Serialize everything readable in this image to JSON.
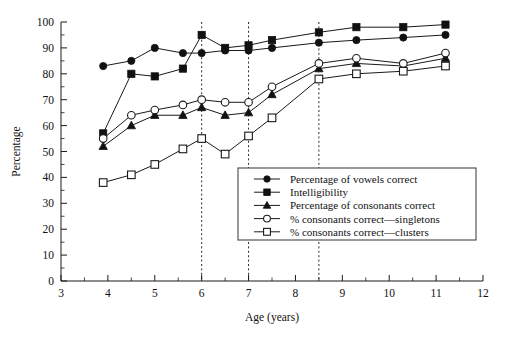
{
  "chart_data": {
    "type": "line",
    "title": "",
    "xlabel": "Age (years)",
    "ylabel": "Percentage",
    "xlim": [
      3,
      12
    ],
    "ylim": [
      0,
      100
    ],
    "xticks": [
      "3",
      "4",
      "5",
      "6",
      "7",
      "8",
      "9",
      "10",
      "11",
      "12"
    ],
    "yticks": [
      "0",
      "10",
      "20",
      "30",
      "40",
      "50",
      "60",
      "70",
      "80",
      "90",
      "100"
    ],
    "x_minor_step": 0.5,
    "y_minor_step": 5,
    "grid": false,
    "legend_position": "lower-right-inside",
    "reference_lines": [
      {
        "axis": "x",
        "value": 6,
        "style": "dotted"
      },
      {
        "axis": "x",
        "value": 7,
        "style": "dotted"
      },
      {
        "axis": "x",
        "value": 8.5,
        "style": "dotted"
      }
    ],
    "series": [
      {
        "name": "Percentage of vowels correct",
        "marker": "filled-circle",
        "x": [
          3.9,
          4.5,
          5.0,
          5.6,
          6.0,
          6.5,
          7.0,
          7.5,
          8.5,
          9.3,
          10.3,
          11.2
        ],
        "y": [
          83,
          85,
          90,
          88,
          88,
          89,
          89,
          90,
          92,
          93,
          94,
          95
        ]
      },
      {
        "name": "Intelligibility",
        "marker": "filled-square",
        "x": [
          3.9,
          4.5,
          5.0,
          5.6,
          6.0,
          6.5,
          7.0,
          7.5,
          8.5,
          9.3,
          10.3,
          11.2
        ],
        "y": [
          57,
          80,
          79,
          82,
          95,
          90,
          91,
          93,
          96,
          98,
          98,
          99
        ]
      },
      {
        "name": "Percentage of consonants correct",
        "marker": "filled-triangle",
        "x": [
          3.9,
          4.5,
          5.0,
          5.6,
          6.0,
          6.5,
          7.0,
          7.5,
          8.5,
          9.3,
          10.3,
          11.2
        ],
        "y": [
          52,
          60,
          64,
          64,
          67,
          64,
          65,
          72,
          82,
          84,
          83,
          86
        ]
      },
      {
        "name": "% consonants correct—singletons",
        "marker": "open-circle",
        "x": [
          3.9,
          4.5,
          5.0,
          5.6,
          6.0,
          6.5,
          7.0,
          7.5,
          8.5,
          9.3,
          10.3,
          11.2
        ],
        "y": [
          55,
          64,
          66,
          68,
          70,
          69,
          69,
          75,
          84,
          86,
          84,
          88
        ]
      },
      {
        "name": "% consonants correct—clusters",
        "marker": "open-square",
        "x": [
          3.9,
          4.5,
          5.0,
          5.6,
          6.0,
          6.5,
          7.0,
          7.5,
          8.5,
          9.3,
          10.3,
          11.2
        ],
        "y": [
          38,
          41,
          45,
          51,
          55,
          49,
          56,
          63,
          78,
          80,
          81,
          83
        ]
      }
    ]
  },
  "legend": {
    "items": [
      {
        "label": "Percentage of vowels correct",
        "marker": "filled-circle"
      },
      {
        "label": "Intelligibility",
        "marker": "filled-square"
      },
      {
        "label": "Percentage of consonants correct",
        "marker": "filled-triangle"
      },
      {
        "label": "% consonants correct—singletons",
        "marker": "open-circle"
      },
      {
        "label": "% consonants correct—clusters",
        "marker": "open-square"
      }
    ]
  },
  "colors": {
    "ink": "#111111",
    "axis": "#1a1a1a",
    "background": "#ffffff",
    "reference_line": "#2b2b2b"
  }
}
